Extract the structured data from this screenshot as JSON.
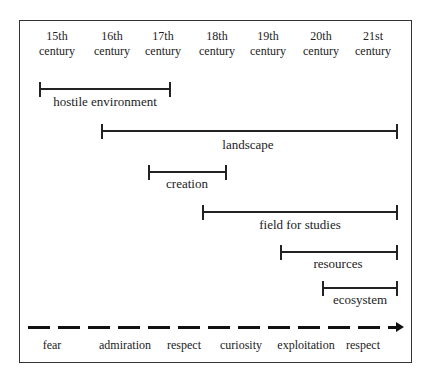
{
  "centuries": [
    {
      "l1": "15th",
      "l2": "century",
      "x": 57
    },
    {
      "l1": "16th",
      "l2": "century",
      "x": 112
    },
    {
      "l1": "17th",
      "l2": "century",
      "x": 163
    },
    {
      "l1": "18th",
      "l2": "century",
      "x": 217
    },
    {
      "l1": "19th",
      "l2": "century",
      "x": 268
    },
    {
      "l1": "20th",
      "l2": "century",
      "x": 321
    },
    {
      "l1": "21st",
      "l2": "century",
      "x": 373
    }
  ],
  "periods": [
    {
      "label": "hostile environment",
      "x1": 40,
      "x2": 170,
      "y": 88,
      "lx": 105,
      "ly": 94
    },
    {
      "label": "landscape",
      "x1": 102,
      "x2": 397,
      "y": 130,
      "lx": 248,
      "ly": 137
    },
    {
      "label": "creation",
      "x1": 149,
      "x2": 226,
      "y": 171,
      "lx": 187,
      "ly": 176
    },
    {
      "label": "field for studies",
      "x1": 203,
      "x2": 397,
      "y": 211,
      "lx": 300,
      "ly": 217
    },
    {
      "label": "resources",
      "x1": 281,
      "x2": 397,
      "y": 251,
      "lx": 338,
      "ly": 256
    },
    {
      "label": "ecosystem",
      "x1": 323,
      "x2": 397,
      "y": 287,
      "lx": 360,
      "ly": 292
    }
  ],
  "attitudes": [
    {
      "label": "fear",
      "x": 52
    },
    {
      "label": "admiration",
      "x": 125
    },
    {
      "label": "respect",
      "x": 184
    },
    {
      "label": "curiosity",
      "x": 241
    },
    {
      "label": "exploitation",
      "x": 306
    },
    {
      "label": "respect",
      "x": 363
    }
  ]
}
